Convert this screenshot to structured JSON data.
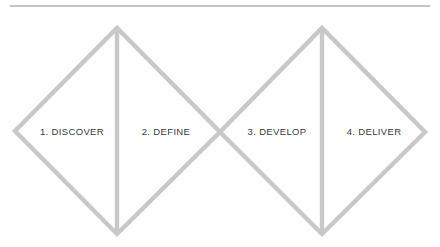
{
  "diagram": {
    "name": "Double Diamond design process",
    "top_rule": {
      "name": "horizontal-divider",
      "color": "#b0b0b0",
      "x1": 10,
      "x2": 430,
      "y": 6,
      "thickness": 1.3
    },
    "stroke_color": "#c8c8c8",
    "stroke_width": 4.4,
    "text_color": "#3a3a3a",
    "background": "#ffffff",
    "diamonds": [
      {
        "name": "diamond-one",
        "left_apex": [
          15,
          131
        ],
        "top_apex": [
          117,
          28
        ],
        "right_apex": [
          220,
          132
        ],
        "bottom_apex": [
          117,
          234
        ],
        "divider_x": 117
      },
      {
        "name": "diamond-two",
        "left_apex": [
          220,
          132
        ],
        "top_apex": [
          322,
          28
        ],
        "right_apex": [
          425,
          132
        ],
        "bottom_apex": [
          322,
          234
        ],
        "divider_x": 322
      }
    ],
    "phases": [
      {
        "label": "1. DISCOVER",
        "cx": 72,
        "cy": 132
      },
      {
        "label": "2. DEFINE",
        "cx": 166,
        "cy": 132
      },
      {
        "label": "3. DEVELOP",
        "cx": 277,
        "cy": 132
      },
      {
        "label": "4. DELIVER",
        "cx": 374,
        "cy": 132
      }
    ]
  }
}
